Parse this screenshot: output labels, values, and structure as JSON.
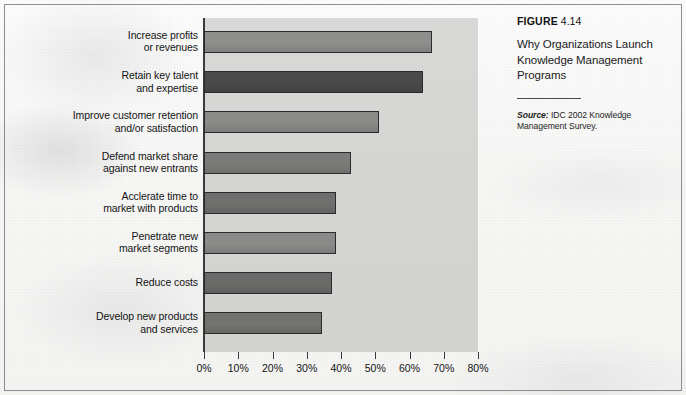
{
  "caption": {
    "figure_word": "FIGURE",
    "figure_number": "4.14",
    "title": "Why Organizations Launch Knowledge Management Programs",
    "source_word": "Source:",
    "source_text": "IDC 2002 Knowledge Management Survey."
  },
  "chart_data": {
    "type": "bar",
    "orientation": "horizontal",
    "title": "Why Organizations Launch Knowledge Management Programs",
    "xlabel": "",
    "ylabel": "",
    "xlim": [
      0,
      80
    ],
    "xtick_labels": [
      "0%",
      "10%",
      "20%",
      "30%",
      "40%",
      "50%",
      "60%",
      "70%",
      "80%"
    ],
    "xticks": [
      0,
      10,
      20,
      30,
      40,
      50,
      60,
      70,
      80
    ],
    "grid": false,
    "legend": "none",
    "unit": "%",
    "categories": [
      "Increase profits\nor revenues",
      "Retain key talent\nand expertise",
      "Improve customer retention\nand/or satisfaction",
      "Defend market share\nagainst new entrants",
      "Acclerate time to\nmarket with products",
      "Penetrate new\nmarket segments",
      "Reduce costs",
      "Develop new products\nand services"
    ],
    "values": [
      66.5,
      64,
      51,
      43,
      38.5,
      38.5,
      37.5,
      34.5
    ],
    "bar_colors": [
      "#8e8e8c",
      "#4a4a4a",
      "#8a8a88",
      "#7b7b79",
      "#6f6f6d",
      "#8a8a88",
      "#6a6a68",
      "#74746f"
    ],
    "plot_background": "#d5d5d3",
    "axis_color": "#3a3a3a"
  }
}
